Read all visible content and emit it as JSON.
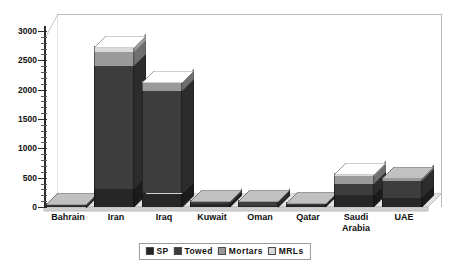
{
  "chart_data": {
    "type": "bar",
    "subtype": "stacked-column-3d",
    "title": "",
    "subtitle": "",
    "xlabel": "",
    "ylabel": "",
    "ylim": [
      0,
      3000
    ],
    "yticks": [
      0,
      500,
      1000,
      1500,
      2000,
      2500,
      3000
    ],
    "ytick_labels": [
      "0",
      "500",
      "1000",
      "1500",
      "2000",
      "2500",
      "3000"
    ],
    "minor_tick_step": 100,
    "grid": false,
    "legend_position": "bottom",
    "categories": [
      "Bahrain",
      "Iran",
      "Iraq",
      "Kuwait",
      "Oman",
      "Qatar",
      "Saudi\nArabia",
      "UAE"
    ],
    "series": [
      {
        "name": "SP",
        "color": "#262626",
        "values": [
          20,
          310,
          230,
          55,
          24,
          30,
          200,
          155
        ]
      },
      {
        "name": "Towed",
        "color": "#3d3d3d",
        "values": [
          36,
          2100,
          1750,
          40,
          80,
          45,
          200,
          290
        ]
      },
      {
        "name": "Mortars",
        "color": "#9a9a9a",
        "values": [
          12,
          230,
          140,
          18,
          18,
          14,
          120,
          60
        ]
      },
      {
        "name": "MRLs",
        "color": "#d9d9d9",
        "values": [
          0,
          110,
          30,
          0,
          0,
          0,
          60,
          0
        ]
      }
    ],
    "totals": [
      68,
      2750,
      2150,
      113,
      122,
      89,
      580,
      505
    ]
  },
  "legend": {
    "items": [
      {
        "label": "SP",
        "color": "#262626"
      },
      {
        "label": "Towed",
        "color": "#3d3d3d"
      },
      {
        "label": "Mortars",
        "color": "#9a9a9a"
      },
      {
        "label": "MRLs",
        "color": "#d9d9d9"
      }
    ]
  },
  "axis": {
    "y_tick_labels": [
      "3000",
      "2500",
      "2000",
      "1500",
      "1000",
      "500",
      "0"
    ]
  },
  "colors": {
    "background": "#ffffff",
    "plot_border": "#b9b9b9",
    "floor_top": "#e2e2e2",
    "floor_front": "#c9c9c9",
    "axis": "#2b2b2b",
    "text": "#111111"
  }
}
